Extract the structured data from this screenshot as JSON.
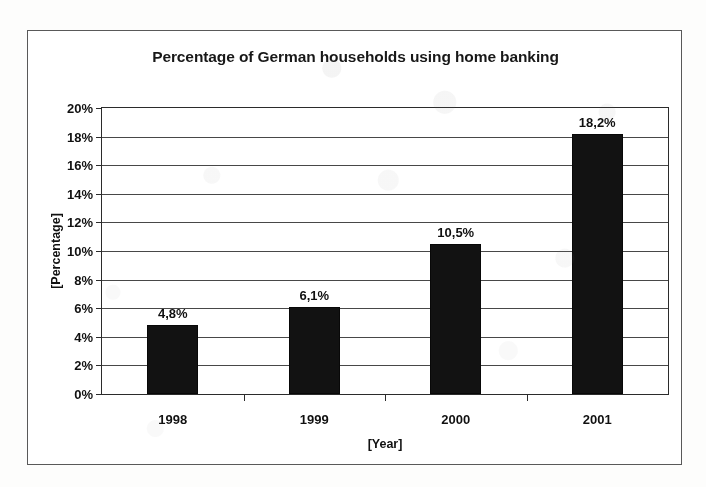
{
  "chart_data": {
    "type": "bar",
    "title": "Percentage of German households using home banking",
    "xlabel": "[Year]",
    "ylabel": "[Percentage]",
    "categories": [
      "1998",
      "1999",
      "2000",
      "2001"
    ],
    "values": [
      4.8,
      6.1,
      10.5,
      18.2
    ],
    "value_labels": [
      "4,8%",
      "6,1%",
      "10,5%",
      "18,2%"
    ],
    "ylim": [
      0,
      20
    ],
    "ytick_values": [
      0,
      2,
      4,
      6,
      8,
      10,
      12,
      14,
      16,
      18,
      20
    ],
    "ytick_labels": [
      "0%",
      "2%",
      "4%",
      "6%",
      "8%",
      "10%",
      "12%",
      "14%",
      "16%",
      "18%",
      "20%"
    ],
    "grid": true,
    "legend": false,
    "legend_position": "none",
    "series": [
      {
        "name": "Percentage of German households using home banking",
        "values": [
          4.8,
          6.1,
          10.5,
          18.2
        ]
      }
    ],
    "colors": {
      "bar": "#151515",
      "axis": "#2d2d2d",
      "grid": "#3b3b3b",
      "text": "#141414",
      "plot_background": "#ffffff",
      "frame_border": "#5a5a5a",
      "page_background": "#fdfdfc"
    }
  }
}
